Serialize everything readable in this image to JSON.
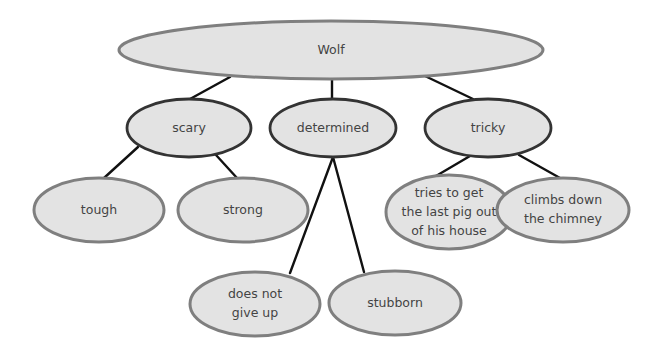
{
  "diagram": {
    "type": "concept-map",
    "colors": {
      "node_fill": "#e3e3e3",
      "outer_stroke": "#7f7f7f",
      "mid_stroke": "#333333",
      "line": "#111111",
      "text": "#444444"
    },
    "root": {
      "id": "wolf",
      "label": "Wolf",
      "cx": 331,
      "cy": 50,
      "rx": 212,
      "ry": 29
    },
    "traits": [
      {
        "id": "scary",
        "label": "scary",
        "cx": 189,
        "cy": 128,
        "rx": 62,
        "ry": 29
      },
      {
        "id": "determined",
        "label": "determined",
        "cx": 333,
        "cy": 128,
        "rx": 63,
        "ry": 29
      },
      {
        "id": "tricky",
        "label": "tricky",
        "cx": 488,
        "cy": 128,
        "rx": 63,
        "ry": 29
      }
    ],
    "details": [
      {
        "id": "tough",
        "parent": "scary",
        "lines": [
          "tough"
        ],
        "cx": 99,
        "cy": 210,
        "rx": 65,
        "ry": 32
      },
      {
        "id": "strong",
        "parent": "scary",
        "lines": [
          "strong"
        ],
        "cx": 243,
        "cy": 210,
        "rx": 65,
        "ry": 32
      },
      {
        "id": "tries",
        "parent": "tricky",
        "lines": [
          "tries to get",
          "the last pig out",
          "of his house"
        ],
        "cx": 449,
        "cy": 212,
        "rx": 63,
        "ry": 37
      },
      {
        "id": "climbs",
        "parent": "tricky",
        "lines": [
          "climbs down",
          "the chimney"
        ],
        "cx": 563,
        "cy": 210,
        "rx": 66,
        "ry": 32
      },
      {
        "id": "gives-up",
        "parent": "determined",
        "lines": [
          "does not",
          "give up"
        ],
        "cx": 255,
        "cy": 304,
        "rx": 65,
        "ry": 32
      },
      {
        "id": "stubborn",
        "parent": "determined",
        "lines": [
          "stubborn"
        ],
        "cx": 395,
        "cy": 303,
        "rx": 66,
        "ry": 32
      }
    ],
    "edges": [
      {
        "from": "wolf",
        "to": "scary",
        "x1": 230,
        "y1": 77,
        "x2": 190,
        "y2": 99
      },
      {
        "from": "wolf",
        "to": "determined",
        "x1": 332,
        "y1": 79,
        "x2": 332,
        "y2": 99
      },
      {
        "from": "wolf",
        "to": "tricky",
        "x1": 425,
        "y1": 76,
        "x2": 473,
        "y2": 99
      },
      {
        "from": "scary",
        "to": "tough",
        "x1": 138,
        "y1": 147,
        "x2": 104,
        "y2": 178
      },
      {
        "from": "scary",
        "to": "strong",
        "x1": 216,
        "y1": 155,
        "x2": 237,
        "y2": 178
      },
      {
        "from": "determined",
        "to": "gives-up",
        "x1": 333,
        "y1": 157,
        "x2": 290,
        "y2": 273
      },
      {
        "from": "determined",
        "to": "stubborn",
        "x1": 333,
        "y1": 157,
        "x2": 364,
        "y2": 272
      },
      {
        "from": "tricky",
        "to": "tries",
        "x1": 470,
        "y1": 156,
        "x2": 436,
        "y2": 176
      },
      {
        "from": "tricky",
        "to": "climbs",
        "x1": 519,
        "y1": 155,
        "x2": 560,
        "y2": 178
      }
    ]
  }
}
